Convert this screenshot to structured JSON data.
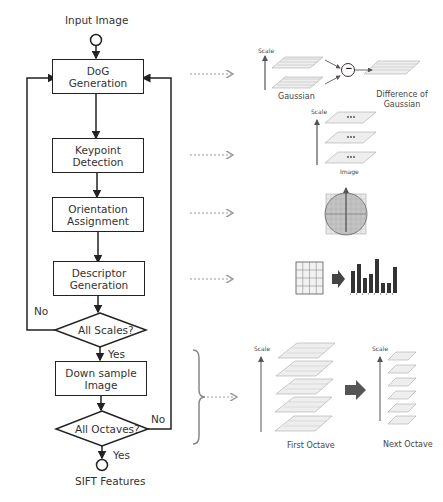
{
  "flowchart": {
    "start": "Input Image",
    "end": "SIFT Features",
    "steps": [
      {
        "line1": "DoG",
        "line2": "Generation"
      },
      {
        "line1": "Keypoint",
        "line2": "Detection"
      },
      {
        "line1": "Orientation",
        "line2": "Assignment"
      },
      {
        "line1": "Descriptor",
        "line2": "Generation"
      },
      {
        "line1": "Down sample",
        "line2": "Image"
      }
    ],
    "decisions": [
      {
        "label": "All Scales?",
        "no": "No",
        "yes": "Yes"
      },
      {
        "label": "All Octaves?",
        "no": "No",
        "yes": "Yes"
      }
    ]
  },
  "illustrations": {
    "dog": {
      "scale_label": "Scale",
      "gaussian_label": "Gaussian",
      "operator": "−",
      "result_line1": "Difference of",
      "result_line2": "Gaussian"
    },
    "keypoint": {
      "scale_label": "Scale",
      "image_label": "Image"
    },
    "octaves": {
      "scale_label_first": "Scale",
      "scale_label_next": "Scale",
      "first_label": "First Octave",
      "next_label": "Next Octave"
    }
  },
  "colors": {
    "line": "#222222",
    "dotted_arrow": "#999999",
    "grid": "#888888",
    "bar": "#333333"
  }
}
